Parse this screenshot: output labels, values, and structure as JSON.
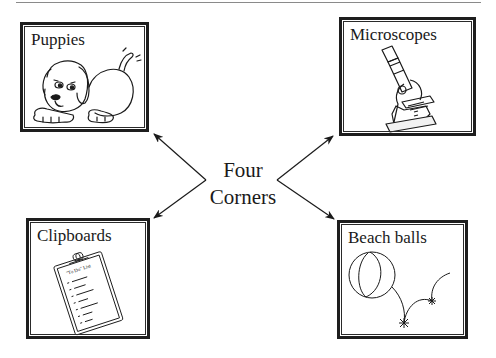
{
  "diagram": {
    "center_label": {
      "line1": "Four",
      "line2": "Corners"
    },
    "corners": [
      {
        "position": "top-left",
        "label": "Puppies",
        "illustration": "puppy-icon"
      },
      {
        "position": "top-right",
        "label": "Microscopes",
        "illustration": "microscope-icon"
      },
      {
        "position": "bottom-left",
        "label": "Clipboards",
        "illustration": "clipboard-icon",
        "clipboard_heading": "\"To Do\" List",
        "clipboard_items": [
          "1.",
          "2.",
          "3.",
          "4.",
          "5.",
          "6.",
          "7."
        ]
      },
      {
        "position": "bottom-right",
        "label": "Beach balls",
        "illustration": "beach-ball-icon"
      }
    ],
    "colors": {
      "ink": "#1a1a1a",
      "rule": "#8a8a8a",
      "background": "#ffffff"
    }
  }
}
